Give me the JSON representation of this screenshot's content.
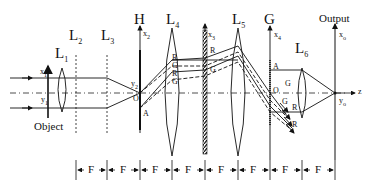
{
  "figure": {
    "type": "optical-4f-system-diagram",
    "planes": {
      "object": {
        "label": "Object",
        "x_axis": "x",
        "x_sub": "1",
        "y_axis": "y",
        "y_sub": "1"
      },
      "L1": {
        "label": "L",
        "sub": "1"
      },
      "L2": {
        "label": "L",
        "sub": "2"
      },
      "L3": {
        "label": "L",
        "sub": "3"
      },
      "H": {
        "label": "H",
        "axis": "x",
        "axis_sub": "2",
        "y_axis": "y",
        "y_sub": "2",
        "origin": "O",
        "point": "A"
      },
      "L4": {
        "label": "L",
        "sub": "4",
        "ray_labels": [
          "R",
          "G",
          "R",
          "G"
        ]
      },
      "x3": {
        "axis": "x",
        "axis_sub": "3",
        "ray_labels": [
          "R",
          "G"
        ]
      },
      "L5": {
        "label": "L",
        "sub": "5"
      },
      "G": {
        "label": "G",
        "axis": "x",
        "axis_sub": "4",
        "origin": "O",
        "point": "A",
        "ray_labels": [
          "G",
          "G",
          "R",
          "R"
        ]
      },
      "L6": {
        "label": "L",
        "sub": "6"
      },
      "output": {
        "label": "Output",
        "x_axis": "x",
        "x_sub": "o",
        "y_axis": "y",
        "y_sub": "o",
        "z_axis": "z"
      }
    },
    "spacing": {
      "label": "F",
      "segments": [
        "F",
        "F",
        "F",
        "F",
        "F",
        "F",
        "F",
        "F"
      ]
    }
  }
}
